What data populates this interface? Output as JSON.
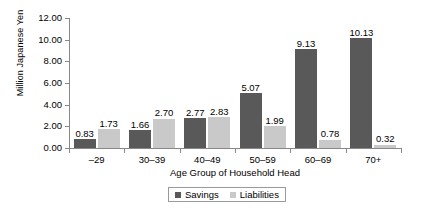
{
  "chart_data": {
    "type": "bar",
    "title": "",
    "xlabel": "Age Group of Household Head",
    "ylabel": "Million Japanese Yen",
    "categories": [
      "–29",
      "30–39",
      "40–49",
      "50–59",
      "60–69",
      "70+"
    ],
    "series": [
      {
        "name": "Savings",
        "color": "#595959",
        "values": [
          0.83,
          1.66,
          2.77,
          5.07,
          9.13,
          10.13
        ],
        "labels": [
          "0.83",
          "1.66",
          "2.77",
          "5.07",
          "9.13",
          "10.13"
        ]
      },
      {
        "name": "Liabilities",
        "color": "#c9c9c9",
        "values": [
          1.73,
          2.7,
          2.83,
          1.99,
          0.78,
          0.32
        ],
        "labels": [
          "1.73",
          "2.70",
          "2.83",
          "1.99",
          "0.78",
          "0.32"
        ]
      }
    ],
    "ylim": [
      0,
      12
    ],
    "ytick_values": [
      0,
      2,
      4,
      6,
      8,
      10,
      12
    ],
    "ytick_labels": [
      "0.00",
      "2.00",
      "4.00",
      "6.00",
      "8.00",
      "10.00",
      "12.00"
    ],
    "grid": false,
    "legend_position": "bottom-center"
  }
}
